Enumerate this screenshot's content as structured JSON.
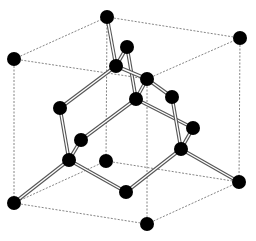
{
  "colors": {
    "background": "#ffffff",
    "atom": "#000000",
    "bond_outer": "#555555",
    "bond_inner": "#ffffff",
    "cell_edge": "#666666"
  },
  "atoms": [
    {
      "id": "a0",
      "x": 107,
      "y": 17
    },
    {
      "id": "a1",
      "x": 240,
      "y": 38
    },
    {
      "id": "a2",
      "x": 14,
      "y": 59
    },
    {
      "id": "a3",
      "x": 127,
      "y": 47
    },
    {
      "id": "a4",
      "x": 116,
      "y": 66
    },
    {
      "id": "a5",
      "x": 147,
      "y": 79
    },
    {
      "id": "a6",
      "x": 136,
      "y": 99
    },
    {
      "id": "a7",
      "x": 172,
      "y": 97
    },
    {
      "id": "a8",
      "x": 60,
      "y": 108
    },
    {
      "id": "a9",
      "x": 193,
      "y": 128
    },
    {
      "id": "a10",
      "x": 81,
      "y": 140
    },
    {
      "id": "a11",
      "x": 181,
      "y": 149
    },
    {
      "id": "a12",
      "x": 106,
      "y": 161
    },
    {
      "id": "a13",
      "x": 69,
      "y": 160
    },
    {
      "id": "a14",
      "x": 126,
      "y": 192
    },
    {
      "id": "a15",
      "x": 239,
      "y": 182
    },
    {
      "id": "a16",
      "x": 14,
      "y": 203
    },
    {
      "id": "a17",
      "x": 147,
      "y": 224
    }
  ],
  "bonds": [
    [
      "a0",
      "a4"
    ],
    [
      "a3",
      "a4"
    ],
    [
      "a3",
      "a6"
    ],
    [
      "a4",
      "a5"
    ],
    [
      "a4",
      "a8"
    ],
    [
      "a5",
      "a6"
    ],
    [
      "a5",
      "a7"
    ],
    [
      "a6",
      "a10"
    ],
    [
      "a6",
      "a9"
    ],
    [
      "a7",
      "a11"
    ],
    [
      "a9",
      "a11"
    ],
    [
      "a8",
      "a13"
    ],
    [
      "a10",
      "a13"
    ],
    [
      "a13",
      "a16"
    ],
    [
      "a13",
      "a14"
    ],
    [
      "a11",
      "a14"
    ],
    [
      "a11",
      "a15"
    ]
  ],
  "cell_edges": [
    [
      "a2",
      "a0"
    ],
    [
      "a0",
      "a1"
    ],
    [
      "a2",
      "a5"
    ],
    [
      "a5",
      "a1"
    ],
    [
      "a2",
      "a16"
    ],
    [
      "a0",
      "a12"
    ],
    [
      "a1",
      "a15"
    ],
    [
      "a5",
      "a17"
    ],
    [
      "a16",
      "a12"
    ],
    [
      "a12",
      "a15"
    ],
    [
      "a16",
      "a17"
    ],
    [
      "a17",
      "a15"
    ]
  ],
  "atom_radius": 7
}
